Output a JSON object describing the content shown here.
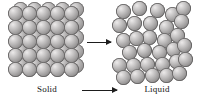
{
  "figure": {
    "background_color": "#ffffff",
    "particle_color": "#a3a1a1",
    "particle_outline_color": "#5f5d5d",
    "arrow_color": "#1d1d1d",
    "text_color": "#141414"
  },
  "labels": {
    "solid": "Solid",
    "liquid": "Liquid"
  },
  "arrows": [
    {
      "name": "upper-arrow",
      "direction": "right"
    },
    {
      "name": "lower-arrow",
      "direction": "right"
    }
  ],
  "solid_state": {
    "label": "Solid",
    "arrangement": "ordered cubic lattice",
    "rows": 5,
    "columns": 5,
    "back_layer_offset": {
      "x": 5,
      "y": -4
    },
    "sphere_diameter": 15,
    "spacing": 14,
    "origin": {
      "x": 8,
      "y": 6
    },
    "particle_count": 50
  },
  "liquid_state": {
    "label": "Liquid",
    "arrangement": "disordered close packing",
    "sphere_diameter": 15,
    "particle_count": 31,
    "positions": [
      [
        4,
        4
      ],
      [
        20,
        1
      ],
      [
        38,
        3
      ],
      [
        53,
        7
      ],
      [
        64,
        1
      ],
      [
        0,
        18
      ],
      [
        15,
        16
      ],
      [
        31,
        16
      ],
      [
        47,
        20
      ],
      [
        62,
        14
      ],
      [
        30,
        30
      ],
      [
        45,
        33
      ],
      [
        58,
        28
      ],
      [
        4,
        33
      ],
      [
        17,
        31
      ],
      [
        10,
        45
      ],
      [
        25,
        43
      ],
      [
        40,
        45
      ],
      [
        54,
        42
      ],
      [
        65,
        38
      ],
      [
        0,
        58
      ],
      [
        14,
        58
      ],
      [
        28,
        57
      ],
      [
        43,
        57
      ],
      [
        57,
        54
      ],
      [
        4,
        70
      ],
      [
        18,
        69
      ],
      [
        33,
        68
      ],
      [
        47,
        68
      ],
      [
        60,
        66
      ],
      [
        66,
        52
      ]
    ]
  }
}
